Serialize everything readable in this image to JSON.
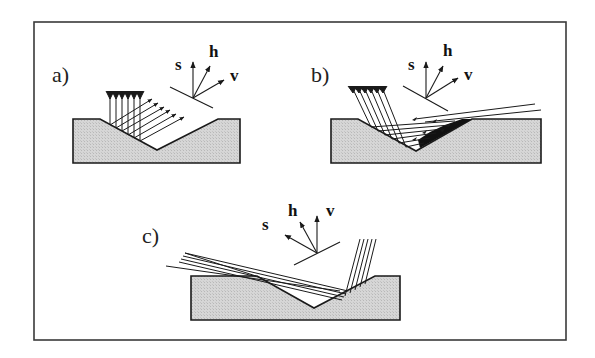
{
  "figure": {
    "panels": [
      {
        "id": "a",
        "label": "a)",
        "axes": {
          "s": "s",
          "h": "h",
          "v": "v"
        },
        "description": "Vertical rays enter V-groove, reflect horizontally toward upper-right facet"
      },
      {
        "id": "b",
        "label": "b)",
        "axes": {
          "s": "s",
          "h": "h",
          "v": "v"
        },
        "description": "Inclined rays enter V-groove and exit at grazing angle to the right"
      },
      {
        "id": "c",
        "label": "c)",
        "axes": {
          "s": "s",
          "h": "h",
          "v": "v"
        },
        "description": "Grazing rays from left cross the groove; steep rays near right facet"
      }
    ],
    "colors": {
      "block_fill": "#d4d4d4",
      "stroke": "#1a1a1a",
      "background": "#ffffff"
    }
  }
}
